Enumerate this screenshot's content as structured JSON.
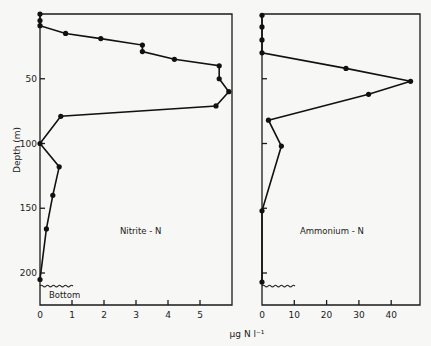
{
  "chart_data": [
    {
      "type": "line",
      "title": "Nitrite-N",
      "panel_label": "Nitrite - N",
      "xlabel": "µg N l⁻¹",
      "ylabel": "Depth (m)",
      "xlim": [
        0,
        6
      ],
      "ylim": [
        210,
        0
      ],
      "x_ticks": [
        "0",
        "1",
        "2",
        "3",
        "4",
        "5"
      ],
      "y_ticks": [
        "50",
        "100",
        "150",
        "200"
      ],
      "bottom_label": "Bottom",
      "bottom_depth_m": 207,
      "series": [
        {
          "name": "Nitrite-N",
          "depth_m": [
            0,
            5,
            9,
            15,
            19,
            24,
            29,
            35,
            40,
            50,
            60,
            71,
            79,
            100,
            118,
            140,
            166,
            205
          ],
          "values": [
            0,
            0,
            0,
            0.8,
            1.9,
            3.2,
            3.2,
            4.2,
            5.6,
            5.6,
            5.9,
            5.5,
            0.65,
            0,
            0.6,
            0.4,
            0.2,
            0
          ]
        }
      ]
    },
    {
      "type": "line",
      "title": "Ammonium-N",
      "panel_label": "Ammonium - N",
      "xlabel": "µg N l⁻¹",
      "ylabel": "Depth (m)",
      "xlim": [
        0,
        49
      ],
      "ylim": [
        210,
        0
      ],
      "x_ticks": [
        "0",
        "10",
        "20",
        "30",
        "40"
      ],
      "series": [
        {
          "name": "Ammonium-N",
          "depth_m": [
            1,
            10,
            20,
            30,
            42,
            52,
            62,
            82,
            102,
            152,
            207
          ],
          "values": [
            0,
            0,
            0,
            0,
            26,
            46,
            33,
            2,
            6,
            0,
            0
          ]
        }
      ]
    }
  ],
  "labels": {
    "ylabel": "Depth (m)",
    "xlabel_unit": "µg N l⁻¹",
    "nitrite": "Nitrite - N",
    "ammonium": "Ammonium - N",
    "bottom": "Bottom"
  }
}
